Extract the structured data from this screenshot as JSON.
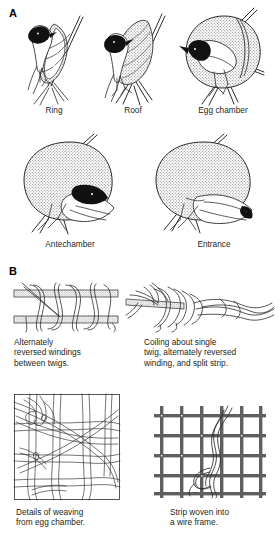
{
  "figure": {
    "panels": [
      {
        "id": "A",
        "letter": "A"
      },
      {
        "id": "B",
        "letter": "B"
      }
    ]
  },
  "panel_a": {
    "letter": "A",
    "stages": [
      {
        "id": "ring",
        "label": "Ring",
        "description": "weaver bird perched on twig with woven ring"
      },
      {
        "id": "roof",
        "label": "Roof",
        "description": "woven ring extended into a conical roof"
      },
      {
        "id": "egg-chamber",
        "label": "Egg chamber",
        "description": "rounded egg chamber woven behind the ring"
      },
      {
        "id": "antechamber",
        "label": "Antechamber",
        "description": "globular nest with antechamber added below"
      },
      {
        "id": "entrance",
        "label": "Entrance",
        "description": "completed nest with downward entrance tube"
      }
    ]
  },
  "panel_b": {
    "letter": "B",
    "techniques": [
      {
        "id": "alternately-reversed-windings",
        "caption_lines": [
          "Alternately",
          "reversed windings",
          "between twigs."
        ],
        "description": "strip wound back and forth between two parallel twigs"
      },
      {
        "id": "coiling-single-twig",
        "caption_lines": [
          "Coiling about single",
          "twig, alternately reversed",
          "winding, and split strip."
        ],
        "description": "strip coiled around one twig with reversed winding and split end"
      },
      {
        "id": "details-of-weaving",
        "caption_lines": [
          "Details of weaving",
          "from egg chamber."
        ],
        "description": "close-up of interlaced grass strips from the egg chamber wall"
      },
      {
        "id": "strip-woven-wire-frame",
        "caption_lines": [
          "Strip woven into",
          "a wire frame."
        ],
        "description": "single grass strip woven through a square wire mesh"
      }
    ]
  },
  "colors": {
    "background": "#ffffff",
    "ink": "#231f20",
    "line": "#3a3a3a",
    "stipple_gray": "#9a9a9a",
    "stipple_light": "#b9b9b9",
    "head_black": "#111111",
    "wire_gray": "#5f5f5f",
    "caption_text": "#231f20"
  }
}
